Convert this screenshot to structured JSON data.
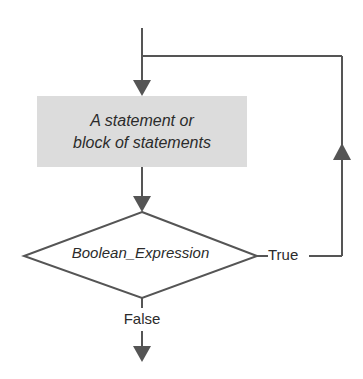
{
  "diagram": {
    "type": "flowchart",
    "colors": {
      "line": "#555555",
      "box_fill": "#dcdcdc",
      "text": "#2b2b2b",
      "background": "#ffffff"
    },
    "nodes": [
      {
        "id": "statement",
        "shape": "rectangle",
        "line1": "A statement or",
        "line2": "block of statements"
      },
      {
        "id": "condition",
        "shape": "diamond",
        "label": "Boolean_Expression"
      }
    ],
    "edges": [
      {
        "from": "entry",
        "to": "statement",
        "label": ""
      },
      {
        "from": "statement",
        "to": "condition",
        "label": ""
      },
      {
        "from": "condition",
        "to": "statement",
        "label": "True"
      },
      {
        "from": "condition",
        "to": "exit",
        "label": "False"
      }
    ],
    "labels": {
      "true": "True",
      "false": "False"
    }
  }
}
